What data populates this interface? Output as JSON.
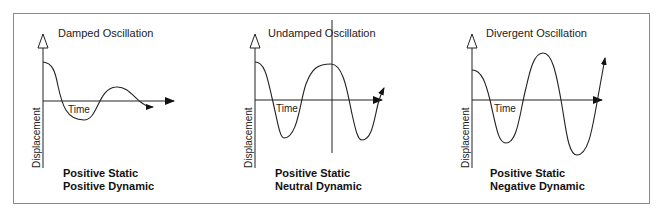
{
  "figure": {
    "frame_color": "#777777",
    "line_color": "#222222",
    "panels": [
      {
        "title": "Damped Oscillation",
        "x_axis_label": "Time",
        "y_axis_label": "Displacement",
        "stability_line1": "Positive Static",
        "stability_line2": "Positive Dynamic"
      },
      {
        "title": "Undamped Oscillation",
        "x_axis_label": "Time",
        "y_axis_label": "Displacement",
        "stability_line1": "Positive Static",
        "stability_line2": "Neutral Dynamic"
      },
      {
        "title": "Divergent Oscillation",
        "x_axis_label": "Time",
        "y_axis_label": "Displacement",
        "stability_line1": "Positive Static",
        "stability_line2": "Negative Dynamic"
      }
    ]
  }
}
